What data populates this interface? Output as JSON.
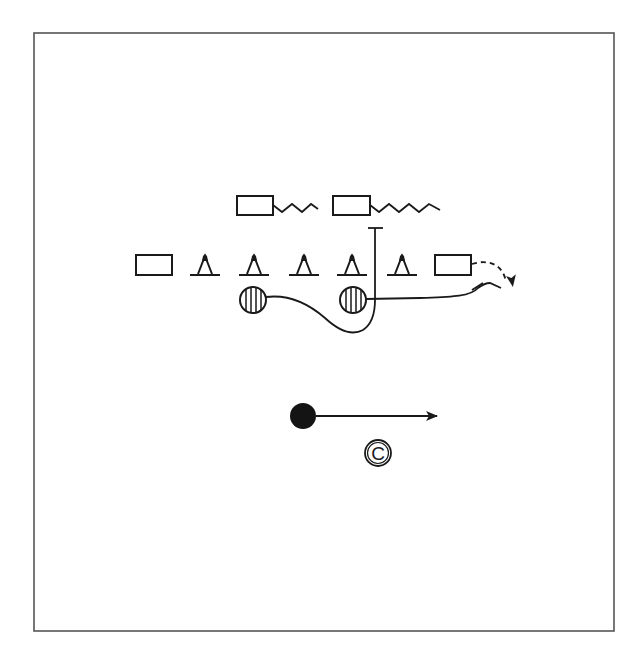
{
  "diagram": {
    "type": "football-play",
    "frame": {
      "x": 34,
      "y": 33,
      "width": 580,
      "height": 598,
      "color": "#555555"
    },
    "line_color": "#1a1a1a",
    "defenders_top": [
      {
        "id": "defender-1",
        "shape": "rectangle",
        "x": 237,
        "y": 196,
        "w": 36,
        "h": 19,
        "motion": "zigzag-short"
      },
      {
        "id": "defender-2",
        "shape": "rectangle",
        "x": 333,
        "y": 196,
        "w": 37,
        "h": 19,
        "motion": "zigzag-long"
      }
    ],
    "line_row": [
      {
        "id": "end-left",
        "shape": "rectangle",
        "x": 136,
        "y": 255,
        "w": 36,
        "h": 20
      },
      {
        "id": "lineman-1",
        "shape": "triangle",
        "cx": 205
      },
      {
        "id": "lineman-2",
        "shape": "triangle",
        "cx": 254
      },
      {
        "id": "lineman-3",
        "shape": "triangle",
        "cx": 304
      },
      {
        "id": "lineman-4",
        "shape": "triangle",
        "cx": 352
      },
      {
        "id": "lineman-5",
        "shape": "triangle",
        "cx": 402
      },
      {
        "id": "end-right",
        "shape": "rectangle",
        "x": 435,
        "y": 255,
        "w": 36,
        "h": 20
      }
    ],
    "backs": [
      {
        "id": "back-left",
        "shape": "hatched-circle",
        "cx": 253,
        "cy": 300,
        "r": 13
      },
      {
        "id": "back-right",
        "shape": "hatched-circle",
        "cx": 353,
        "cy": 300,
        "r": 13
      }
    ],
    "ball": {
      "cx": 303,
      "cy": 416,
      "r": 13,
      "arrow_to_x": 437
    },
    "coach_marker": {
      "symbol": "©",
      "cx": 378,
      "cy": 453
    }
  }
}
